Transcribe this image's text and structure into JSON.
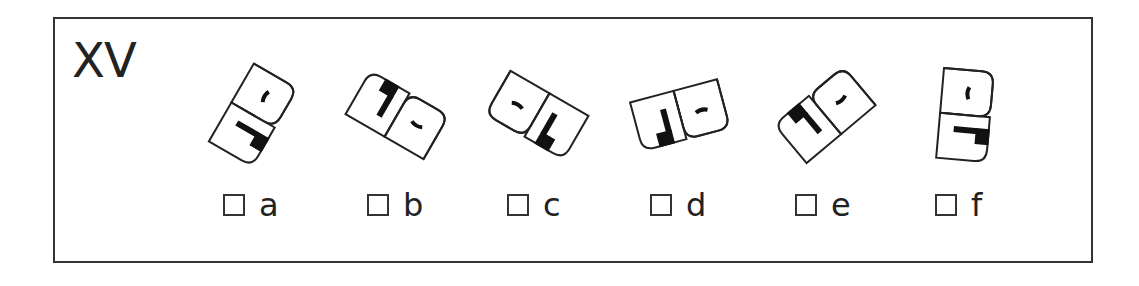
{
  "question": {
    "number": "XV",
    "options": [
      {
        "letter": "a",
        "checked": false,
        "figure": {
          "cx": 253,
          "rotate": 30,
          "mirror": false
        }
      },
      {
        "letter": "b",
        "checked": false,
        "figure": {
          "cx": 397,
          "rotate": 120,
          "mirror": true
        }
      },
      {
        "letter": "c",
        "checked": false,
        "figure": {
          "cx": 537,
          "rotate": -60,
          "mirror": true
        }
      },
      {
        "letter": "d",
        "checked": false,
        "figure": {
          "cx": 680,
          "rotate": 75,
          "mirror": false
        }
      },
      {
        "letter": "e",
        "checked": false,
        "figure": {
          "cx": 825,
          "rotate": 50,
          "mirror": true
        }
      },
      {
        "letter": "f",
        "checked": false,
        "figure": {
          "cx": 965,
          "rotate": 5,
          "mirror": false
        }
      }
    ]
  },
  "colors": {
    "stroke": "#222222",
    "fill": "#111111",
    "frame": "#333333"
  }
}
